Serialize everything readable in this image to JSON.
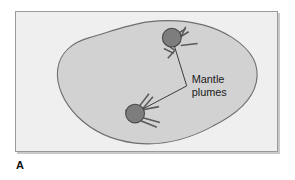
{
  "figure": {
    "panel_letter": "A",
    "annotation": {
      "line1": "Mantle",
      "line2": "plumes"
    },
    "colors": {
      "page_background": "#ffffff",
      "frame_background": "#efefef",
      "frame_border": "#9a9a9a",
      "frame_shadow": "#c9c9c9",
      "plate_fill": "#d2d2d2",
      "plate_outline": "#6e6e6e",
      "plume_circle_fill": "#7d7d7d",
      "plume_circle_stroke": "#4a4a4a",
      "plume_spoke": "#5a5a5a",
      "leader_line": "#3a3a3a",
      "label_text": "#1b1b1b"
    },
    "plumes": [
      {
        "name": "upper-plume",
        "cx": 172,
        "cy": 37,
        "r": 9.5,
        "spokes": [
          {
            "angle_deg": -62,
            "length": 18,
            "double": true
          },
          {
            "angle_deg": 6,
            "length": 17,
            "double": false
          },
          {
            "angle_deg": 118,
            "length": 14,
            "double": true
          }
        ]
      },
      {
        "name": "lower-plume",
        "cx": 135,
        "cy": 113,
        "r": 9.5,
        "spokes": [
          {
            "angle_deg": -60,
            "length": 19,
            "double": true
          },
          {
            "angle_deg": -12,
            "length": 15,
            "double": false
          },
          {
            "angle_deg": 42,
            "length": 17,
            "double": true
          },
          {
            "angle_deg": 180,
            "length": 16,
            "double": false
          }
        ]
      }
    ],
    "leader": {
      "vertex_x": 187,
      "vertex_y": 86
    }
  }
}
